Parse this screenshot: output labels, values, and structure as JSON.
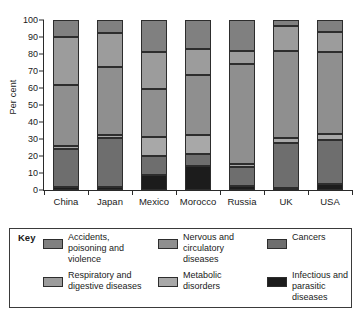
{
  "chart_data": {
    "type": "bar",
    "subtype": "stacked-percentage",
    "title": "",
    "xlabel": "",
    "ylabel": "Per cent",
    "ylim": [
      0,
      100
    ],
    "yticks": [
      0,
      10,
      20,
      30,
      40,
      50,
      60,
      70,
      80,
      90,
      100
    ],
    "grid": false,
    "legend_position": "below-plot",
    "categories": [
      "China",
      "Japan",
      "Mexico",
      "Morocco",
      "Russia",
      "UK",
      "USA"
    ],
    "series": [
      {
        "name": "Infectious and parasitic diseases",
        "color": "#1c1c1c",
        "values": [
          2,
          1.5,
          9,
          14,
          2.5,
          1,
          3.5
        ]
      },
      {
        "name": "Cancers",
        "color": "#6e6e6e",
        "values": [
          22,
          29,
          11,
          7,
          11,
          26.5,
          26
        ]
      },
      {
        "name": "Metabolic disorders",
        "color": "#a8a8a8",
        "values": [
          2,
          2,
          11,
          11.5,
          2,
          3,
          3.5
        ]
      },
      {
        "name": "Nervous and circulatory diseases",
        "color": "#8f8f8f",
        "values": [
          35.5,
          40,
          28.5,
          35,
          58.5,
          51.5,
          48
        ]
      },
      {
        "name": "Respiratory and digestive diseases",
        "color": "#9c9c9c",
        "values": [
          28.5,
          20,
          21.5,
          15.5,
          8,
          14.5,
          12
        ]
      },
      {
        "name": "Accidents, poisoning and violence",
        "color": "#808080",
        "values": [
          10,
          7.5,
          19,
          17,
          18,
          3.5,
          7
        ]
      }
    ]
  },
  "legend": {
    "title": "Key",
    "items": [
      {
        "label": "Accidents, poisoning and violence",
        "color": "#808080"
      },
      {
        "label": "Nervous and circulatory diseases",
        "color": "#8f8f8f"
      },
      {
        "label": "Cancers",
        "color": "#6e6e6e"
      },
      {
        "label": "Respiratory and digestive diseases",
        "color": "#9c9c9c"
      },
      {
        "label": "Metabolic disorders",
        "color": "#a8a8a8"
      },
      {
        "label": "Infectious and parasitic diseases",
        "color": "#1c1c1c"
      }
    ]
  }
}
